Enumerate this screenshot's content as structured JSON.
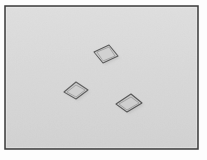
{
  "image": {
    "kind": "photograph-like grayscale scene",
    "width": 207,
    "height": 160,
    "title": "Three flat quadrilateral tiles on a light gray surface",
    "description": "A framed grayscale image showing three small flat parallelogram-shaped tiles scattered across a plain light gray background."
  },
  "frame": {
    "name": "image-border-frame",
    "margin_color": "#fdfdfd",
    "border_color": "#3a3a3a",
    "border_width": 1.5,
    "inset": {
      "left": 5,
      "top": 6,
      "right": 198,
      "bottom": 149
    }
  },
  "background": {
    "name": "gray-surface",
    "fill_color": "#d9d9d9",
    "top_highlight_color": "#dedede",
    "bottom_shade_color": "#d3d3d3",
    "noise_opacity": 0.06
  },
  "palette": {
    "outline_dark": "#555555",
    "outline_mid": "#6e6e6e",
    "fill_light": "#d2d2d2",
    "fill_mid": "#cbcbcb",
    "fill_dark": "#c4c4c4",
    "shadow": "#b8b8b8",
    "white": "#ffffff"
  },
  "objects": [
    {
      "id": "tile-top",
      "name": "quadrilateral-tile-top",
      "label": "Top tile",
      "center": {
        "x": 106,
        "y": 54
      },
      "points": "94,52 109,45 118,56 103,63",
      "inner_points": "97,52 109,47 115,56 103,61",
      "shadow_points": "96,54 111,47 120,58 105,65",
      "fill": "#cdcdcd",
      "inner_fill": "#d2d2d2",
      "outline": "#5a5a5a",
      "outline_width": 1.1,
      "hatch_opacity": 0.22
    },
    {
      "id": "tile-left",
      "name": "quadrilateral-tile-left",
      "label": "Left tile",
      "center": {
        "x": 76,
        "y": 90
      },
      "points": "64,92 76,82 88,90 76,99",
      "inner_points": "67,92 76,85 85,90 76,97",
      "shadow_points": "66,94 78,84 90,92 78,101",
      "fill": "#cacaca",
      "inner_fill": "#d0d0d0",
      "outline": "#5e5e5e",
      "outline_width": 1.1,
      "hatch_opacity": 0.2
    },
    {
      "id": "tile-bottom-right",
      "name": "quadrilateral-tile-bottom-right",
      "label": "Bottom-right tile",
      "center": {
        "x": 129,
        "y": 103
      },
      "points": "116,104 131,94 142,103 127,112",
      "inner_points": "119,104 131,97 139,103 127,110",
      "shadow_points": "118,106 133,96 144,105 129,114",
      "fill": "#c8c8c8",
      "inner_fill": "#cfcfcf",
      "outline": "#565656",
      "outline_width": 1.1,
      "hatch_opacity": 0.24
    }
  ],
  "annotations": {
    "object_count": 3,
    "scene_type": "flat-tiles-on-plane"
  }
}
